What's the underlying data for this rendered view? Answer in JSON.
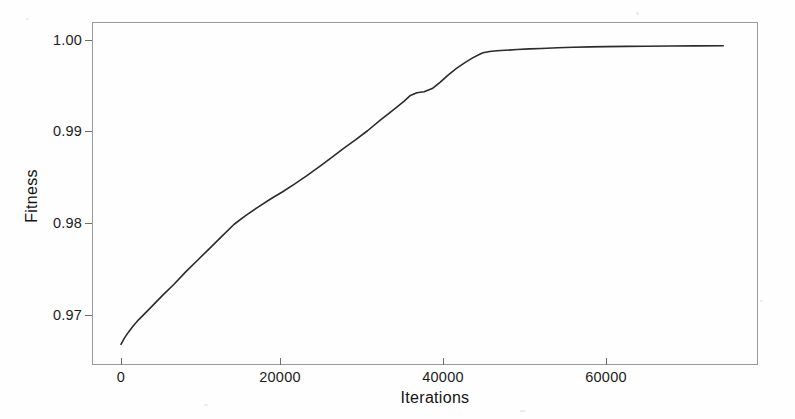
{
  "figure": {
    "background_color": "#fefefe",
    "frame_color": "#9a9a9a",
    "line_color": "#2b2b2b"
  },
  "chart_data": {
    "type": "line",
    "title": "",
    "subtitle": "",
    "xlabel": "Iterations",
    "ylabel": "Fitness",
    "xlim": [
      -2500,
      77000
    ],
    "ylim": [
      0.9655,
      1.0012
    ],
    "xticks": [
      0,
      20000,
      40000,
      60000
    ],
    "xtick_labels": [
      "0",
      "20000",
      "40000",
      "60000"
    ],
    "yticks": [
      0.97,
      0.98,
      0.99,
      1.0
    ],
    "ytick_labels": [
      "0.97",
      "0.98",
      "0.99",
      "1.00"
    ],
    "grid": false,
    "legend": null,
    "annotations": [],
    "series": [
      {
        "name": "Best fitness",
        "color": "#2b2b2b",
        "line_width": 1.6,
        "x": [
          0,
          400,
          900,
          1500,
          2200,
          3000,
          4000,
          5200,
          6500,
          8000,
          9500,
          11000,
          12500,
          14000,
          15500,
          17000,
          18500,
          20000,
          21500,
          23000,
          24500,
          26000,
          27500,
          29000,
          30500,
          32000,
          33500,
          35000,
          35800,
          36600,
          37500,
          38500,
          39500,
          40500,
          41500,
          42500,
          43500,
          44500,
          44800,
          45600,
          46500,
          47500,
          49000,
          50500,
          52000,
          54000,
          56000,
          58000,
          60000,
          62500,
          65000,
          68000,
          71000,
          74500
        ],
        "y": [
          0.9668,
          0.96745,
          0.9681,
          0.9688,
          0.9695,
          0.9702,
          0.9711,
          0.9722,
          0.9733,
          0.9747,
          0.976,
          0.9773,
          0.9786,
          0.9799,
          0.9809,
          0.9818,
          0.98265,
          0.98345,
          0.9843,
          0.9852,
          0.98615,
          0.98715,
          0.98815,
          0.9891,
          0.9901,
          0.9912,
          0.99225,
          0.9933,
          0.99395,
          0.99425,
          0.99435,
          0.9947,
          0.9954,
          0.9962,
          0.9969,
          0.9975,
          0.99805,
          0.9985,
          0.9986,
          0.99875,
          0.99882,
          0.99888,
          0.99896,
          0.99903,
          0.99908,
          0.99915,
          0.99921,
          0.99925,
          0.99928,
          0.9993,
          0.99932,
          0.99934,
          0.99936,
          0.99938
        ]
      }
    ]
  }
}
